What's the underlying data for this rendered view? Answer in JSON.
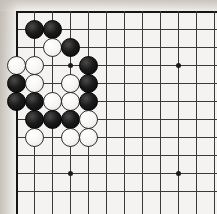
{
  "board": {
    "name": "go-board",
    "game": "Go",
    "visible_columns": 12,
    "visible_rows": 11,
    "origin_x": 16,
    "origin_y": 11,
    "spacing": 18,
    "line_color": "#3a3a3a",
    "edge_color": "#151515",
    "board_color": "#f4f3f1",
    "black_color": "#0a0a0a",
    "white_color": "#fafafa",
    "star_points": [
      {
        "col": 3,
        "row": 3
      },
      {
        "col": 9,
        "row": 3
      },
      {
        "col": 3,
        "row": 9
      },
      {
        "col": 9,
        "row": 9
      }
    ],
    "stones": [
      {
        "col": 1,
        "row": 1,
        "color": "black"
      },
      {
        "col": 2,
        "row": 1,
        "color": "black"
      },
      {
        "col": 2,
        "row": 2,
        "color": "white"
      },
      {
        "col": 3,
        "row": 2,
        "color": "black"
      },
      {
        "col": 0,
        "row": 3,
        "color": "white"
      },
      {
        "col": 1,
        "row": 3,
        "color": "white"
      },
      {
        "col": 4,
        "row": 3,
        "color": "black"
      },
      {
        "col": 0,
        "row": 4,
        "color": "black"
      },
      {
        "col": 1,
        "row": 4,
        "color": "white"
      },
      {
        "col": 3,
        "row": 4,
        "color": "white"
      },
      {
        "col": 4,
        "row": 4,
        "color": "black"
      },
      {
        "col": 0,
        "row": 5,
        "color": "black"
      },
      {
        "col": 1,
        "row": 5,
        "color": "black"
      },
      {
        "col": 2,
        "row": 5,
        "color": "white"
      },
      {
        "col": 3,
        "row": 5,
        "color": "white"
      },
      {
        "col": 4,
        "row": 5,
        "color": "black"
      },
      {
        "col": 1,
        "row": 6,
        "color": "black"
      },
      {
        "col": 2,
        "row": 6,
        "color": "black"
      },
      {
        "col": 3,
        "row": 6,
        "color": "black"
      },
      {
        "col": 4,
        "row": 6,
        "color": "white"
      },
      {
        "col": 1,
        "row": 7,
        "color": "white"
      },
      {
        "col": 3,
        "row": 7,
        "color": "white"
      },
      {
        "col": 4,
        "row": 7,
        "color": "white"
      }
    ]
  }
}
